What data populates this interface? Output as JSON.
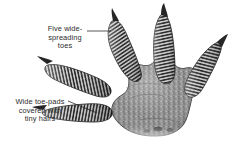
{
  "figure": {
    "background_color": "#ffffff",
    "ink_color": "#2b2b2b",
    "style": "grayscale scientific illustration"
  },
  "annotations": {
    "toes": {
      "text": "Five wide-\nspreading\ntoes",
      "line1": "Five wide-",
      "line2": "spreading",
      "line3": "toes",
      "leader": {
        "x1": 87,
        "y1": 31,
        "x2": 111,
        "y2": 31
      }
    },
    "pads": {
      "text": "Wide toe-pads\ncovered with\ntiny hairs",
      "line1": "Wide toe-pads",
      "line2": "covered with",
      "line3": "tiny hairs",
      "leader": {
        "x1": 68,
        "y1": 101,
        "x2": 97,
        "y2": 113
      }
    }
  },
  "palette": {
    "ink": "#2b2b2b",
    "toe_light": "#c9c9c9",
    "toe_dark": "#1c1c1c",
    "palm_mid": "#8a8a8a",
    "palm_dark": "#4a4a4a",
    "palm_light": "#b5b5b5",
    "claw": "#262626",
    "outline": "#3a3a3a"
  },
  "anatomy": {
    "toe_count": 5,
    "toes": [
      {
        "name": "toe-1-outer-left",
        "tip_x": 46,
        "tip_y": 68
      },
      {
        "name": "toe-2-left",
        "tip_x": 41,
        "tip_y": 112
      },
      {
        "name": "toe-3-upper-left",
        "tip_x": 111,
        "tip_y": 19
      },
      {
        "name": "toe-4-upper-right",
        "tip_x": 163,
        "tip_y": 10
      },
      {
        "name": "toe-5-right",
        "tip_x": 216,
        "tip_y": 44
      }
    ],
    "palm": {
      "center_x": 148,
      "center_y": 95,
      "texture": "granular-scales"
    }
  }
}
